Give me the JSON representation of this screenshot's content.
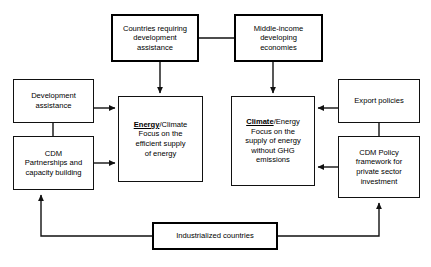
{
  "diagram": {
    "colors": {
      "box_border": "#111111",
      "box_border_emphasis": "#000000",
      "connector": "#111111",
      "background": "#ffffff"
    },
    "nodes": {
      "countries_requiring_development_assistance": {
        "label": "Countries requiring\ndevelopment\nassistance",
        "emphasis": "thick-border"
      },
      "middle_income_developing_economies": {
        "label": "Middle-income\ndeveloping\neconomies",
        "emphasis": "thick-border"
      },
      "development_assistance": {
        "label": "Development\nassistance",
        "emphasis": "thin-border"
      },
      "cdm_partnerships_and_capacity_building": {
        "label": "CDM\nPartnerships and\ncapacity building",
        "emphasis": "thin-border"
      },
      "energy_climate": {
        "headline": "Energy",
        "headline_suffix": "/Climate",
        "body": "Focus on the\nefficient supply\nof energy",
        "emphasis": "thin-border"
      },
      "climate_energy": {
        "headline": "Climate",
        "headline_suffix": "/Energy",
        "body": "Focus on the\nsupply of energy\nwithout GHG\nemissions",
        "emphasis": "thin-border"
      },
      "export_policies": {
        "label": "Export policies",
        "emphasis": "thin-border"
      },
      "cdm_policy_framework": {
        "label": "CDM Policy\nframework for\nprivate sector\ninvestment",
        "emphasis": "thin-border"
      },
      "industrialized_countries": {
        "label": "Industrialized countries",
        "emphasis": "thick-border"
      }
    },
    "connections": [
      {
        "from": "countries_requiring_development_assistance",
        "to": "middle_income_developing_economies",
        "arrow": "none"
      },
      {
        "from": "countries_requiring_development_assistance",
        "to": "energy_climate",
        "arrow": "down"
      },
      {
        "from": "middle_income_developing_economies",
        "to": "climate_energy",
        "arrow": "down"
      },
      {
        "from": "development_assistance",
        "to": "energy_climate",
        "arrow": "right"
      },
      {
        "from": "cdm_partnerships_and_capacity_building",
        "to": "energy_climate",
        "arrow": "right"
      },
      {
        "from": "development_assistance",
        "to": "cdm_partnerships_and_capacity_building",
        "arrow": "none"
      },
      {
        "from": "export_policies",
        "to": "climate_energy",
        "arrow": "left"
      },
      {
        "from": "cdm_policy_framework",
        "to": "climate_energy",
        "arrow": "left"
      },
      {
        "from": "export_policies",
        "to": "cdm_policy_framework",
        "arrow": "none"
      },
      {
        "from": "industrialized_countries",
        "to": "cdm_partnerships_and_capacity_building",
        "arrow": "up"
      },
      {
        "from": "industrialized_countries",
        "to": "cdm_policy_framework",
        "arrow": "up"
      }
    ]
  }
}
